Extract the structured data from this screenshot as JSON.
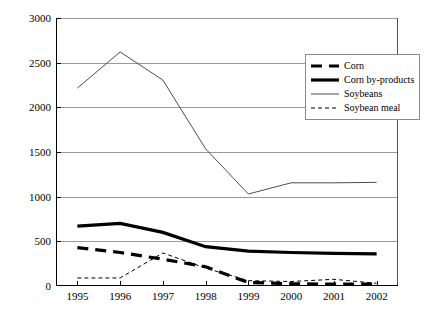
{
  "chart_data": {
    "type": "line",
    "title": "",
    "xlabel": "",
    "ylabel": "",
    "categories": [
      "1995",
      "1996",
      "1997",
      "1998",
      "1999",
      "2000",
      "2001",
      "2002"
    ],
    "ylim": [
      0,
      3000
    ],
    "yticks": [
      0,
      500,
      1000,
      1500,
      2000,
      2500,
      3000
    ],
    "grid": true,
    "legend_position": "upper-right",
    "series": [
      {
        "name": "Corn",
        "style": "thick-dashed",
        "values": [
          430,
          375,
          300,
          215,
          40,
          25,
          20,
          20
        ]
      },
      {
        "name": "Corn by-products",
        "style": "thick-solid",
        "values": [
          670,
          700,
          600,
          440,
          390,
          375,
          365,
          360
        ]
      },
      {
        "name": "Soybeans",
        "style": "thin-solid",
        "values": [
          2215,
          2620,
          2305,
          1535,
          1030,
          1155,
          1155,
          1160
        ]
      },
      {
        "name": "Soybean meal",
        "style": "thin-dashed",
        "values": [
          90,
          90,
          370,
          200,
          60,
          50,
          75,
          30
        ]
      }
    ]
  }
}
